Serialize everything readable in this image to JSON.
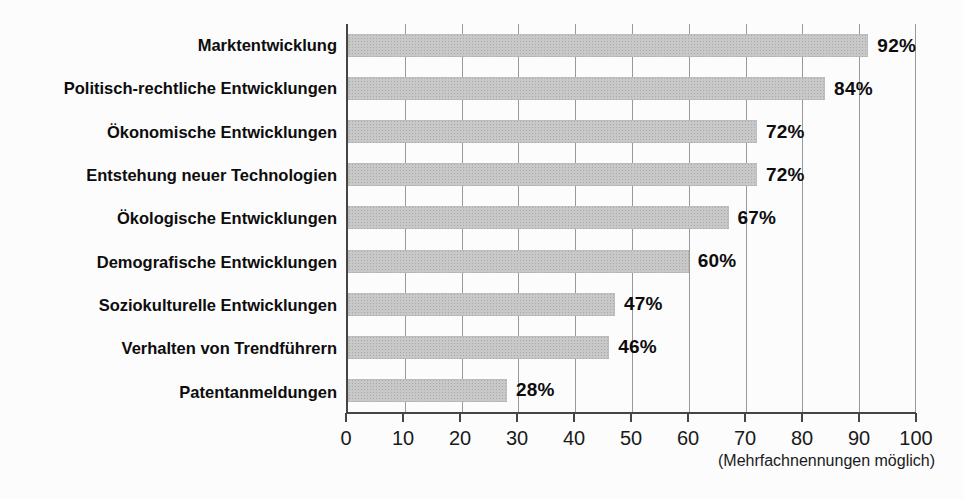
{
  "chart_data": {
    "type": "bar",
    "orientation": "horizontal",
    "title": "",
    "xlabel": "",
    "ylabel": "",
    "xlim": [
      0,
      100
    ],
    "grid": true,
    "bar_color": "#c8c8c8",
    "axis_color": "#454545",
    "gridline_color": "#999999",
    "categories": [
      "Marktentwicklung",
      "Politisch-rechtliche Entwicklungen",
      "Ökonomische Entwicklungen",
      "Entstehung neuer Technologien",
      "Ökologische Entwicklungen",
      "Demografische Entwicklungen",
      "Soziokulturelle Entwicklungen",
      "Verhalten von Trendführern",
      "Patentanmeldungen"
    ],
    "values": [
      92,
      84,
      72,
      72,
      67,
      60,
      47,
      46,
      28
    ],
    "rows": [
      {
        "label": "Marktentwicklung",
        "value": 92,
        "value_label": "92%"
      },
      {
        "label": "Politisch-rechtliche Entwicklungen",
        "value": 84,
        "value_label": "84%"
      },
      {
        "label": "Ökonomische Entwicklungen",
        "value": 72,
        "value_label": "72%"
      },
      {
        "label": "Entstehung neuer Technologien",
        "value": 72,
        "value_label": "72%"
      },
      {
        "label": "Ökologische Entwicklungen",
        "value": 67,
        "value_label": "67%"
      },
      {
        "label": "Demografische Entwicklungen",
        "value": 60,
        "value_label": "60%"
      },
      {
        "label": "Soziokulturelle Entwicklungen",
        "value": 47,
        "value_label": "47%"
      },
      {
        "label": "Verhalten von Trendführern",
        "value": 46,
        "value_label": "46%"
      },
      {
        "label": "Patentanmeldungen",
        "value": 28,
        "value_label": "28%"
      }
    ],
    "axis": {
      "tick_labels": [
        "0",
        "10",
        "20",
        "30",
        "40",
        "50",
        "60",
        "70",
        "80",
        "90",
        "100"
      ]
    },
    "footnote": "(Mehrfachnennungen möglich)"
  }
}
